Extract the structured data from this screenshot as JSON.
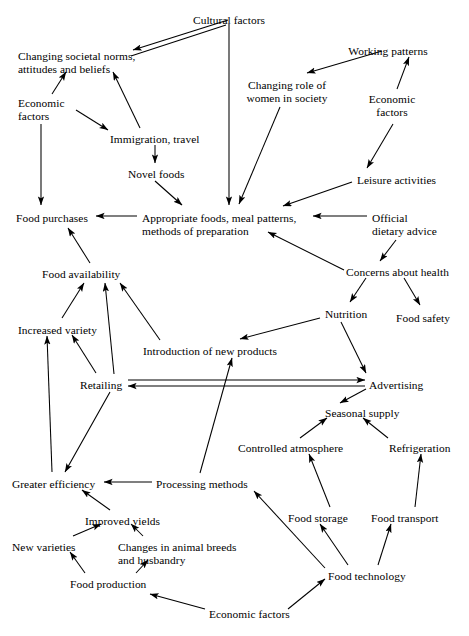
{
  "diagram": {
    "type": "concept-map",
    "stroke_color": "#000000",
    "background_color": "#ffffff",
    "nodes": [
      {
        "id": "cultural_factors",
        "label": "Cultural factors",
        "x": 229,
        "y": 14,
        "align": "c"
      },
      {
        "id": "changing_societal_norms",
        "label": "Changing societal norms,\nattitudes and beliefs",
        "x": 18,
        "y": 50,
        "align": "l"
      },
      {
        "id": "working_patterns",
        "label": "Working patterns",
        "x": 388,
        "y": 45,
        "align": "c"
      },
      {
        "id": "changing_role_women",
        "label": "Changing role of\nwomen in society",
        "x": 287,
        "y": 79,
        "align": "c"
      },
      {
        "id": "economic_factors_left",
        "label": "Economic\nfactors",
        "x": 18,
        "y": 97,
        "align": "l"
      },
      {
        "id": "economic_factors_right",
        "label": "Economic\nfactors",
        "x": 392,
        "y": 93,
        "align": "c"
      },
      {
        "id": "immigration_travel",
        "label": "Immigration, travel",
        "x": 110,
        "y": 133,
        "align": "l"
      },
      {
        "id": "novel_foods",
        "label": "Novel foods",
        "x": 128,
        "y": 168,
        "align": "l"
      },
      {
        "id": "leisure_activities",
        "label": "Leisure activities",
        "x": 357,
        "y": 174,
        "align": "l"
      },
      {
        "id": "food_purchases",
        "label": "Food purchases",
        "x": 16,
        "y": 212,
        "align": "l"
      },
      {
        "id": "appropriate_foods",
        "label": "Appropriate foods, meal patterns,\nmethods of preparation",
        "x": 142,
        "y": 212,
        "align": "l"
      },
      {
        "id": "official_dietary_advice",
        "label": "Official\ndietary advice",
        "x": 372,
        "y": 212,
        "align": "l"
      },
      {
        "id": "food_availability",
        "label": "Food availability",
        "x": 42,
        "y": 268,
        "align": "l"
      },
      {
        "id": "concerns_about_health",
        "label": "Concerns about health",
        "x": 346,
        "y": 266,
        "align": "l"
      },
      {
        "id": "increased_variety",
        "label": "Increased variety",
        "x": 18,
        "y": 324,
        "align": "l"
      },
      {
        "id": "nutrition",
        "label": "Nutrition",
        "x": 325,
        "y": 308,
        "align": "l"
      },
      {
        "id": "food_safety",
        "label": "Food safety",
        "x": 396,
        "y": 312,
        "align": "l"
      },
      {
        "id": "intro_new_products",
        "label": "Introduction of new products",
        "x": 143,
        "y": 345,
        "align": "l"
      },
      {
        "id": "retailing",
        "label": "Retailing",
        "x": 80,
        "y": 379,
        "align": "l"
      },
      {
        "id": "advertising",
        "label": "Advertising",
        "x": 369,
        "y": 379,
        "align": "l"
      },
      {
        "id": "seasonal_supply",
        "label": "Seasonal supply",
        "x": 325,
        "y": 407,
        "align": "l"
      },
      {
        "id": "controlled_atmosphere",
        "label": "Controlled atmosphere",
        "x": 238,
        "y": 442,
        "align": "l"
      },
      {
        "id": "refrigeration",
        "label": "Refrigeration",
        "x": 389,
        "y": 442,
        "align": "l"
      },
      {
        "id": "greater_efficiency",
        "label": "Greater efficiency",
        "x": 12,
        "y": 478,
        "align": "l"
      },
      {
        "id": "processing_methods",
        "label": "Processing methods",
        "x": 156,
        "y": 478,
        "align": "l"
      },
      {
        "id": "improved_yields",
        "label": "Improved yields",
        "x": 85,
        "y": 515,
        "align": "l"
      },
      {
        "id": "food_storage",
        "label": "Food storage",
        "x": 288,
        "y": 512,
        "align": "l"
      },
      {
        "id": "food_transport",
        "label": "Food transport",
        "x": 371,
        "y": 512,
        "align": "l"
      },
      {
        "id": "new_varieties",
        "label": "New varieties",
        "x": 12,
        "y": 541,
        "align": "l"
      },
      {
        "id": "changes_animal_breeds",
        "label": "Changes in animal breeds\nand husbandry",
        "x": 118,
        "y": 541,
        "align": "l"
      },
      {
        "id": "food_technology",
        "label": "Food technology",
        "x": 328,
        "y": 570,
        "align": "l"
      },
      {
        "id": "food_production",
        "label": "Food production",
        "x": 70,
        "y": 578,
        "align": "l"
      },
      {
        "id": "economic_factors_bottom",
        "label": "Economic factors",
        "x": 209,
        "y": 608,
        "align": "l"
      }
    ],
    "edges": [
      {
        "from": "cultural_factors",
        "to": "changing_societal_norms",
        "style": "double-line",
        "arrowhead": "start"
      },
      {
        "from": "cultural_factors",
        "to": "appropriate_foods",
        "style": "line",
        "arrowhead": "end"
      },
      {
        "from": "economic_factors_left",
        "to": "changing_societal_norms",
        "style": "line",
        "arrowhead": "end"
      },
      {
        "from": "economic_factors_left",
        "to": "immigration_travel",
        "style": "line",
        "arrowhead": "end"
      },
      {
        "from": "economic_factors_left",
        "to": "food_purchases",
        "style": "line",
        "arrowhead": "end"
      },
      {
        "from": "immigration_travel",
        "to": "changing_societal_norms",
        "style": "line",
        "arrowhead": "end"
      },
      {
        "from": "immigration_travel",
        "to": "novel_foods",
        "style": "line",
        "arrowhead": "end"
      },
      {
        "from": "novel_foods",
        "to": "appropriate_foods",
        "style": "line",
        "arrowhead": "end"
      },
      {
        "from": "working_patterns",
        "to": "changing_role_women",
        "style": "line",
        "arrowhead": "end"
      },
      {
        "from": "economic_factors_right",
        "to": "working_patterns",
        "style": "line",
        "arrowhead": "end"
      },
      {
        "from": "economic_factors_right",
        "to": "leisure_activities",
        "style": "line",
        "arrowhead": "end"
      },
      {
        "from": "changing_role_women",
        "to": "appropriate_foods",
        "style": "line",
        "arrowhead": "end"
      },
      {
        "from": "leisure_activities",
        "to": "appropriate_foods",
        "style": "line",
        "arrowhead": "end"
      },
      {
        "from": "official_dietary_advice",
        "to": "appropriate_foods",
        "style": "line",
        "arrowhead": "end"
      },
      {
        "from": "official_dietary_advice",
        "to": "concerns_about_health",
        "style": "line",
        "arrowhead": "end"
      },
      {
        "from": "concerns_about_health",
        "to": "appropriate_foods",
        "style": "line",
        "arrowhead": "end"
      },
      {
        "from": "concerns_about_health",
        "to": "nutrition",
        "style": "line",
        "arrowhead": "end"
      },
      {
        "from": "concerns_about_health",
        "to": "food_safety",
        "style": "line",
        "arrowhead": "end"
      },
      {
        "from": "appropriate_foods",
        "to": "food_purchases",
        "style": "line",
        "arrowhead": "end"
      },
      {
        "from": "food_availability",
        "to": "food_purchases",
        "style": "line",
        "arrowhead": "end"
      },
      {
        "from": "increased_variety",
        "to": "food_availability",
        "style": "line",
        "arrowhead": "end"
      },
      {
        "from": "retailing",
        "to": "food_availability",
        "style": "line",
        "arrowhead": "end"
      },
      {
        "from": "intro_new_products",
        "to": "food_availability",
        "style": "line",
        "arrowhead": "end"
      },
      {
        "from": "nutrition",
        "to": "intro_new_products",
        "style": "line",
        "arrowhead": "end"
      },
      {
        "from": "nutrition",
        "to": "advertising",
        "style": "line",
        "arrowhead": "end"
      },
      {
        "from": "retailing",
        "to": "increased_variety",
        "style": "line",
        "arrowhead": "end"
      },
      {
        "from": "retailing",
        "to": "advertising",
        "style": "double-line",
        "arrowhead": "both"
      },
      {
        "from": "retailing",
        "to": "greater_efficiency",
        "style": "line",
        "arrowhead": "end"
      },
      {
        "from": "greater_efficiency",
        "to": "increased_variety",
        "style": "line",
        "arrowhead": "end"
      },
      {
        "from": "advertising",
        "to": "seasonal_supply",
        "style": "line",
        "arrowhead": "end"
      },
      {
        "from": "controlled_atmosphere",
        "to": "seasonal_supply",
        "style": "line",
        "arrowhead": "end"
      },
      {
        "from": "refrigeration",
        "to": "seasonal_supply",
        "style": "line",
        "arrowhead": "end"
      },
      {
        "from": "processing_methods",
        "to": "intro_new_products",
        "style": "line",
        "arrowhead": "end"
      },
      {
        "from": "processing_methods",
        "to": "greater_efficiency",
        "style": "line",
        "arrowhead": "end"
      },
      {
        "from": "food_technology",
        "to": "processing_methods",
        "style": "line",
        "arrowhead": "end"
      },
      {
        "from": "food_technology",
        "to": "food_storage",
        "style": "line",
        "arrowhead": "end"
      },
      {
        "from": "food_technology",
        "to": "food_transport",
        "style": "line",
        "arrowhead": "end"
      },
      {
        "from": "food_storage",
        "to": "controlled_atmosphere",
        "style": "line",
        "arrowhead": "end"
      },
      {
        "from": "food_transport",
        "to": "refrigeration",
        "style": "line",
        "arrowhead": "end"
      },
      {
        "from": "improved_yields",
        "to": "greater_efficiency",
        "style": "line",
        "arrowhead": "end"
      },
      {
        "from": "new_varieties",
        "to": "improved_yields",
        "style": "line",
        "arrowhead": "end"
      },
      {
        "from": "changes_animal_breeds",
        "to": "improved_yields",
        "style": "line",
        "arrowhead": "end"
      },
      {
        "from": "food_production",
        "to": "new_varieties",
        "style": "line",
        "arrowhead": "end"
      },
      {
        "from": "food_production",
        "to": "changes_animal_breeds",
        "style": "line",
        "arrowhead": "end"
      },
      {
        "from": "economic_factors_bottom",
        "to": "food_production",
        "style": "line",
        "arrowhead": "end"
      },
      {
        "from": "economic_factors_bottom",
        "to": "food_technology",
        "style": "line",
        "arrowhead": "end"
      }
    ],
    "edge_paths": [
      {
        "id": "cultural-to-norms-a",
        "x1": 133,
        "y1": 50,
        "x2": 228,
        "y2": 20,
        "head": "start"
      },
      {
        "id": "cultural-to-norms-b",
        "x1": 131,
        "y1": 56,
        "x2": 226,
        "y2": 25,
        "head": "none"
      },
      {
        "id": "cultural-to-appropriate",
        "x1": 229,
        "y1": 24,
        "x2": 229,
        "y2": 205,
        "head": "end"
      },
      {
        "id": "econleft-to-norms",
        "x1": 52,
        "y1": 94,
        "x2": 66,
        "y2": 72,
        "head": "end"
      },
      {
        "id": "econleft-to-immigration",
        "x1": 76,
        "y1": 110,
        "x2": 108,
        "y2": 130,
        "head": "end"
      },
      {
        "id": "econleft-to-purchases",
        "x1": 41,
        "y1": 124,
        "x2": 41,
        "y2": 205,
        "head": "end"
      },
      {
        "id": "immigration-to-norms",
        "x1": 140,
        "y1": 128,
        "x2": 113,
        "y2": 72,
        "head": "end"
      },
      {
        "id": "immigration-to-novel",
        "x1": 155,
        "y1": 145,
        "x2": 155,
        "y2": 163,
        "head": "end"
      },
      {
        "id": "novel-to-appropriate",
        "x1": 155,
        "y1": 181,
        "x2": 182,
        "y2": 205,
        "head": "end"
      },
      {
        "id": "working-to-role",
        "x1": 382,
        "y1": 51,
        "x2": 307,
        "y2": 73,
        "head": "end"
      },
      {
        "id": "econright-to-working",
        "x1": 397,
        "y1": 89,
        "x2": 409,
        "y2": 57,
        "head": "end"
      },
      {
        "id": "econright-to-leisure",
        "x1": 393,
        "y1": 124,
        "x2": 367,
        "y2": 168,
        "head": "end"
      },
      {
        "id": "role-to-appropriate",
        "x1": 280,
        "y1": 107,
        "x2": 239,
        "y2": 204,
        "head": "end"
      },
      {
        "id": "leisure-to-appropriate",
        "x1": 352,
        "y1": 182,
        "x2": 283,
        "y2": 206,
        "head": "end"
      },
      {
        "id": "official-to-appropriate",
        "x1": 367,
        "y1": 216,
        "x2": 313,
        "y2": 216,
        "head": "end"
      },
      {
        "id": "official-to-concerns",
        "x1": 396,
        "y1": 240,
        "x2": 380,
        "y2": 261,
        "head": "end"
      },
      {
        "id": "concerns-to-appropriate",
        "x1": 344,
        "y1": 270,
        "x2": 268,
        "y2": 232,
        "head": "end"
      },
      {
        "id": "concerns-to-nutrition",
        "x1": 366,
        "y1": 278,
        "x2": 350,
        "y2": 302,
        "head": "end"
      },
      {
        "id": "concerns-to-safety",
        "x1": 404,
        "y1": 278,
        "x2": 420,
        "y2": 305,
        "head": "end"
      },
      {
        "id": "appropriate-to-purchases",
        "x1": 137,
        "y1": 216,
        "x2": 96,
        "y2": 216,
        "head": "end"
      },
      {
        "id": "availability-to-purchases",
        "x1": 90,
        "y1": 263,
        "x2": 68,
        "y2": 228,
        "head": "end"
      },
      {
        "id": "variety-to-availability",
        "x1": 62,
        "y1": 318,
        "x2": 84,
        "y2": 283,
        "head": "end"
      },
      {
        "id": "retailing-to-availability",
        "x1": 114,
        "y1": 374,
        "x2": 105,
        "y2": 283,
        "head": "end"
      },
      {
        "id": "intro-to-availability",
        "x1": 160,
        "y1": 340,
        "x2": 120,
        "y2": 283,
        "head": "end"
      },
      {
        "id": "nutrition-to-intro",
        "x1": 320,
        "y1": 318,
        "x2": 240,
        "y2": 339,
        "head": "end"
      },
      {
        "id": "nutrition-to-advertising",
        "x1": 341,
        "y1": 322,
        "x2": 366,
        "y2": 373,
        "head": "end"
      },
      {
        "id": "retailing-to-variety",
        "x1": 96,
        "y1": 373,
        "x2": 72,
        "y2": 335,
        "head": "end"
      },
      {
        "id": "retailing-adv-line-a",
        "x1": 128,
        "y1": 380,
        "x2": 365,
        "y2": 380,
        "head": "end"
      },
      {
        "id": "retailing-adv-line-b",
        "x1": 128,
        "y1": 386,
        "x2": 365,
        "y2": 386,
        "head": "start"
      },
      {
        "id": "retailing-to-efficiency",
        "x1": 110,
        "y1": 392,
        "x2": 65,
        "y2": 472,
        "head": "end"
      },
      {
        "id": "efficiency-to-variety",
        "x1": 52,
        "y1": 472,
        "x2": 47,
        "y2": 336,
        "head": "end"
      },
      {
        "id": "advertising-to-seasonal",
        "x1": 366,
        "y1": 389,
        "x2": 340,
        "y2": 403,
        "head": "end"
      },
      {
        "id": "controlled-to-seasonal",
        "x1": 300,
        "y1": 438,
        "x2": 327,
        "y2": 418,
        "head": "end"
      },
      {
        "id": "refrigeration-to-seasonal",
        "x1": 388,
        "y1": 438,
        "x2": 363,
        "y2": 418,
        "head": "end"
      },
      {
        "id": "processing-to-intro",
        "x1": 200,
        "y1": 473,
        "x2": 232,
        "y2": 358,
        "head": "end"
      },
      {
        "id": "processing-to-efficiency",
        "x1": 152,
        "y1": 482,
        "x2": 104,
        "y2": 482,
        "head": "end"
      },
      {
        "id": "technology-to-processing",
        "x1": 325,
        "y1": 568,
        "x2": 254,
        "y2": 491,
        "head": "end"
      },
      {
        "id": "technology-to-storage",
        "x1": 348,
        "y1": 565,
        "x2": 320,
        "y2": 524,
        "head": "end"
      },
      {
        "id": "technology-to-transport",
        "x1": 378,
        "y1": 565,
        "x2": 391,
        "y2": 524,
        "head": "end"
      },
      {
        "id": "storage-to-controlled",
        "x1": 330,
        "y1": 507,
        "x2": 309,
        "y2": 454,
        "head": "end"
      },
      {
        "id": "transport-to-refrigeration",
        "x1": 415,
        "y1": 507,
        "x2": 421,
        "y2": 454,
        "head": "end"
      },
      {
        "id": "yields-to-efficiency",
        "x1": 110,
        "y1": 510,
        "x2": 82,
        "y2": 490,
        "head": "end"
      },
      {
        "id": "newvar-to-yields",
        "x1": 73,
        "y1": 536,
        "x2": 101,
        "y2": 524,
        "head": "end"
      },
      {
        "id": "breeds-to-yields",
        "x1": 143,
        "y1": 536,
        "x2": 131,
        "y2": 524,
        "head": "end"
      },
      {
        "id": "production-to-newvar",
        "x1": 85,
        "y1": 573,
        "x2": 70,
        "y2": 552,
        "head": "end"
      },
      {
        "id": "production-to-breeds",
        "x1": 136,
        "y1": 573,
        "x2": 148,
        "y2": 560,
        "head": "end"
      },
      {
        "id": "econbottom-to-production",
        "x1": 205,
        "y1": 609,
        "x2": 150,
        "y2": 594,
        "head": "end"
      },
      {
        "id": "econbottom-to-technology",
        "x1": 288,
        "y1": 609,
        "x2": 325,
        "y2": 579,
        "head": "end"
      }
    ]
  }
}
